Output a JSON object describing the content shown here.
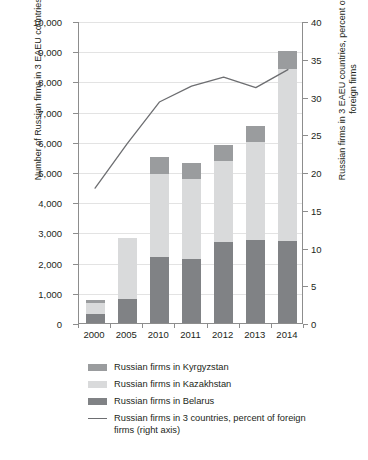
{
  "chart_data": {
    "type": "bar",
    "subtype": "stacked-bar-with-line",
    "title": "",
    "xlabel": "",
    "ylabel": "Number of Russian firms in 3 EAEU countries",
    "y2label": "Russian firms in 3 EAEU countries, percent of foreign firms",
    "categories": [
      "2000",
      "2005",
      "2010",
      "2011",
      "2012",
      "2013",
      "2014"
    ],
    "ylim": [
      0,
      10000
    ],
    "y2lim": [
      0,
      40
    ],
    "yticks": [
      "0",
      "1,000",
      "2,000",
      "3,000",
      "4,000",
      "5,000",
      "6,000",
      "7,000",
      "8,000",
      "9,000",
      "10,000"
    ],
    "ytick_values": [
      0,
      1000,
      2000,
      3000,
      4000,
      5000,
      6000,
      7000,
      8000,
      9000,
      10000
    ],
    "y2ticks": [
      "0",
      "5",
      "10",
      "15",
      "20",
      "25",
      "30",
      "35",
      "40"
    ],
    "y2tick_values": [
      0,
      5,
      10,
      15,
      20,
      25,
      30,
      35,
      40
    ],
    "grid": true,
    "legend_position": "bottom",
    "series": [
      {
        "name": "Russian firms in Belarus",
        "axis": "left",
        "stack_order": 0,
        "color": "#808285",
        "values": [
          300,
          800,
          2180,
          2130,
          2670,
          2760,
          2720
        ]
      },
      {
        "name": "Russian firms in Kazakhstan",
        "axis": "left",
        "stack_order": 1,
        "color": "#d9dadb",
        "values": [
          370,
          2000,
          2740,
          2640,
          2690,
          3230,
          5680
        ]
      },
      {
        "name": "Russian firms in Kyrgyzstan",
        "axis": "left",
        "stack_order": 2,
        "color": "#9a9c9e",
        "values": [
          80,
          0,
          570,
          530,
          520,
          550,
          600
        ]
      },
      {
        "name": "Russian firms in 3 countries, percent of foreign firms (right axis)",
        "axis": "right",
        "type": "line",
        "color": "#6d6e71",
        "values": [
          18.0,
          23.9,
          29.4,
          31.5,
          32.7,
          31.3,
          33.7
        ]
      }
    ],
    "stacked_totals": [
      750,
      2800,
      5490,
      5300,
      5880,
      6540,
      9000
    ]
  },
  "legend": {
    "items": [
      {
        "label": "Russian firms in Kyrgyzstan",
        "swatch": "#9a9c9e",
        "marker": "square"
      },
      {
        "label": "Russian firms in Kazakhstan",
        "swatch": "#d9dadb",
        "marker": "square"
      },
      {
        "label": "Russian firms in Belarus",
        "swatch": "#808285",
        "marker": "square"
      },
      {
        "label": "Russian firms in 3 countries, percent of foreign firms (right axis)",
        "swatch": "#6d6e71",
        "marker": "line"
      }
    ]
  },
  "axes": {
    "left_title": "Number of Russian firms in 3 EAEU countries",
    "right_title": "Russian firms in 3 EAEU countries, percent of foreign firms"
  },
  "colors": {
    "axis": "#8d8d8d",
    "grid": "#e3e3e3",
    "text": "#231f20",
    "background": "#ffffff"
  }
}
